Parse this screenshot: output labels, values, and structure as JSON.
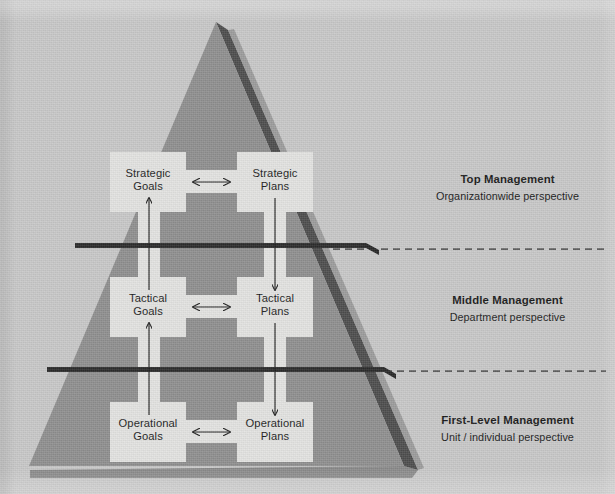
{
  "figure": {
    "background_color": "#c8c8c8",
    "pyramid_face_color": "#8b8b8b",
    "pyramid_side_color": "#4a4a4a",
    "panel_color": "#e2e2e0",
    "divider_color": "#2b2b2b",
    "arrow_color": "#1f1f1f"
  },
  "levels": [
    {
      "id": "strategic",
      "goals_label": "Strategic\nGoals",
      "plans_label": "Strategic\nPlans",
      "legend_title": "Top Management",
      "legend_subtitle": "Organizationwide perspective"
    },
    {
      "id": "tactical",
      "goals_label": "Tactical\nGoals",
      "plans_label": "Tactical\nPlans",
      "legend_title": "Middle Management",
      "legend_subtitle": "Department perspective"
    },
    {
      "id": "operational",
      "goals_label": "Operational\nGoals",
      "plans_label": "Operational\nPlans",
      "legend_title": "First-Level Management",
      "legend_subtitle": "Unit / individual perspective"
    }
  ],
  "connectors": {
    "horizontal_icon": "double-headed-horizontal-arrow",
    "vertical_down_icon": "down-arrow",
    "vertical_up_icon": "up-arrow"
  }
}
